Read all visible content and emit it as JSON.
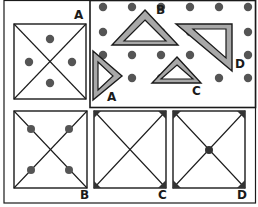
{
  "figure": {
    "colors": {
      "line": "#1a1a1a",
      "dot": "#555555",
      "triangle_fill": "#a8a8a8",
      "background": "#ffffff"
    }
  },
  "top_left_panel": {
    "label": "A",
    "square": {
      "dots": [
        "top",
        "left",
        "right",
        "bottom"
      ]
    }
  },
  "pegboard": {
    "dot_rows": 4,
    "dot_cols": 6,
    "triangles": [
      {
        "label": "A"
      },
      {
        "label": "B"
      },
      {
        "label": "C"
      },
      {
        "label": "D"
      }
    ]
  },
  "answer_squares": [
    {
      "label": "B",
      "marks": "dots on diagonals near corners"
    },
    {
      "label": "C",
      "marks": "corner wedges on diagonal ends"
    },
    {
      "label": "D",
      "marks": "corner wedges and center dot"
    }
  ]
}
